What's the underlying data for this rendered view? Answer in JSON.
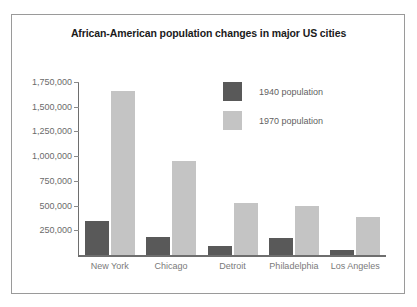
{
  "figure": {
    "background_color": "#ffffff",
    "border_color": "#9a9a9a"
  },
  "chart_data": {
    "type": "bar",
    "title": "African-American population changes in major US cities",
    "xlabel": "",
    "ylabel": "",
    "categories": [
      "New York",
      "Chicago",
      "Detroit",
      "Philadelphia",
      "Los Angeles"
    ],
    "series": [
      {
        "name": "1940 population",
        "color": "#595959",
        "values": [
          340000,
          180000,
          90000,
          170000,
          55000
        ]
      },
      {
        "name": "1970 population",
        "color": "#c4c4c4",
        "values": [
          1660000,
          950000,
          530000,
          500000,
          380000
        ]
      }
    ],
    "ylim": [
      0,
      1750000
    ],
    "ytick_values": [
      1750000,
      1500000,
      1250000,
      1000000,
      750000,
      500000,
      250000
    ],
    "ytick_labels": [
      "1,750,000",
      "1,500,000",
      "1,250,000",
      "1,000,000",
      "750,000",
      "500,000",
      "250,000"
    ],
    "grid": false,
    "legend_position": "upper center",
    "legend_entries": [
      "1940 population",
      "1970 population"
    ]
  }
}
